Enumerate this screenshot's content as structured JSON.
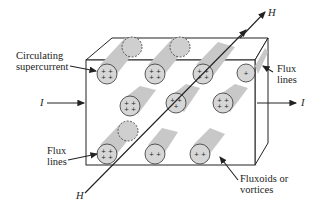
{
  "labels": {
    "circulating": [
      "Circulating",
      "supercurrent"
    ],
    "flux_right": [
      "Flux",
      "lines"
    ],
    "flux_left": [
      "Flux",
      "lines"
    ],
    "fluxoids": [
      "Fluxoids or",
      "vortices"
    ],
    "current_in": "I",
    "current_out": "I",
    "field_top": "H",
    "field_bottom": "H"
  },
  "colors": {
    "line": "#222222",
    "tube": "#c8c8c8",
    "face": "#d9d9d9"
  }
}
